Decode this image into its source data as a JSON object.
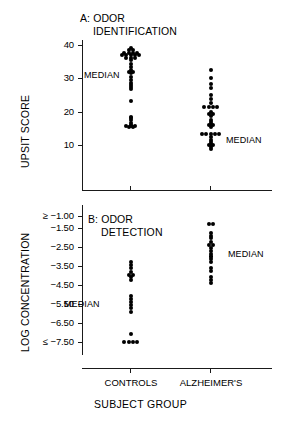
{
  "figure": {
    "x_axis_title": "SUBJECT GROUP",
    "group_labels": [
      "CONTROLS",
      "ALZHEIMER'S"
    ],
    "median_label": "MEDIAN"
  },
  "chart_data": [
    {
      "type": "scatter",
      "panel": "A",
      "title": "A: ODOR\n   IDENTIFICATION",
      "title_line1": "A: ODOR",
      "title_line2": "IDENTIFICATION",
      "ylabel": "UPSIT SCORE",
      "xlabel": "SUBJECT GROUP",
      "ylim": [
        5,
        42
      ],
      "yticks": [
        40,
        30,
        20,
        10
      ],
      "ytick_labels": [
        "40",
        "30",
        "20",
        "10"
      ],
      "categories": [
        "CONTROLS",
        "ALZHEIMER'S"
      ],
      "grid": false,
      "legend": "none",
      "medians": [
        {
          "group": "CONTROLS",
          "value": 31,
          "label": "MEDIAN",
          "label_side": "left"
        },
        {
          "group": "ALZHEIMER'S",
          "value": 16,
          "label": "MEDIAN",
          "label_side": "right"
        }
      ],
      "series": [
        {
          "name": "CONTROLS",
          "values": [
            39.2,
            38.4,
            38.4,
            37.6,
            37.6,
            37.6,
            37.6,
            37.0,
            37.0,
            37.0,
            37.0,
            37.0,
            36.2,
            36.2,
            36.2,
            35.4,
            34.4,
            33.4,
            32.4,
            32.0,
            32.0,
            31.6,
            30.4,
            29.4,
            28.6,
            28.0,
            27.4,
            26.8,
            23.2,
            18.4,
            18.0,
            17.6,
            16.6,
            16.0,
            15.6,
            15.6,
            15.6,
            15.4,
            15.4
          ]
        },
        {
          "name": "ALZHEIMER'S",
          "values": [
            32.4,
            30.0,
            28.4,
            27.0,
            25.0,
            23.8,
            22.6,
            21.4,
            21.4,
            21.4,
            21.4,
            20.0,
            19.4,
            19.4,
            18.6,
            17.6,
            17.0,
            16.4,
            16.0,
            16.0,
            15.4,
            13.2,
            13.2,
            13.2,
            13.2,
            13.2,
            12.4,
            11.6,
            11.0,
            10.4,
            10.0,
            10.0,
            9.4,
            8.8
          ]
        }
      ]
    },
    {
      "type": "scatter",
      "panel": "B",
      "title": "B: ODOR\n   DETECTION",
      "title_line1": "B: ODOR",
      "title_line2": "DETECTION",
      "ylabel": "LOG CONCENTRATION",
      "xlabel": "SUBJECT GROUP",
      "ylim": [
        -7.5,
        -1.0
      ],
      "yticks": [
        -1.0,
        -1.5,
        -2.5,
        -3.5,
        -4.5,
        -5.5,
        -6.5,
        -7.5
      ],
      "ytick_labels": [
        "≥ −1.00",
        "−1.50",
        "−2.50",
        "−3.50",
        "−4.50",
        "−5.50",
        "−6.50",
        "≤ −7.50"
      ],
      "categories": [
        "CONTROLS",
        "ALZHEIMER'S"
      ],
      "grid": false,
      "legend": "none",
      "medians": [
        {
          "group": "CONTROLS",
          "value": -5.5,
          "label": "MEDIAN",
          "label_side": "left"
        },
        {
          "group": "ALZHEIMER'S",
          "value": -2.75,
          "label": "MEDIAN",
          "label_side": "right"
        }
      ],
      "series": [
        {
          "name": "CONTROLS",
          "values": [
            -3.3,
            -3.45,
            -3.6,
            -3.8,
            -3.95,
            -3.95,
            -4.1,
            -4.25,
            -5.1,
            -5.25,
            -5.4,
            -5.55,
            -5.7,
            -5.9,
            -7.1,
            -7.5,
            -7.5,
            -7.5,
            -7.5
          ]
        },
        {
          "name": "ALZHEIMER'S",
          "values": [
            -1.35,
            -1.35,
            -1.75,
            -1.9,
            -2.05,
            -2.25,
            -2.4,
            -2.4,
            -2.55,
            -2.7,
            -2.85,
            -3.0,
            -3.15,
            -3.3,
            -3.6,
            -3.75,
            -4.1,
            -4.25,
            -4.4
          ]
        }
      ]
    }
  ]
}
